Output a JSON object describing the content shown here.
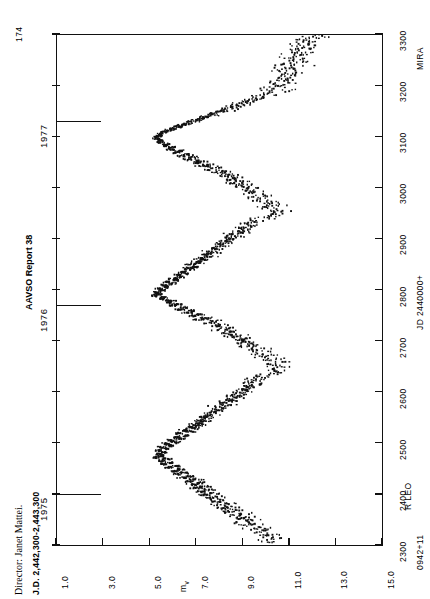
{
  "page": {
    "number": "174",
    "report_title": "AAVSO Report 38",
    "director": "Director: Janet Mattei.",
    "jd_range_note": "J.D. 2,442,300-2,443,300"
  },
  "star": {
    "designation": "0942+11",
    "name": "R LEO",
    "type": "MIRA"
  },
  "axes": {
    "magnitude": {
      "label": "m",
      "label_sub": "v",
      "ticks": [
        "1.0",
        "3.0",
        "5.0",
        "7.0",
        "9.0",
        "11.0",
        "13.0",
        "15.0"
      ],
      "min": 1.0,
      "max": 15.0
    },
    "time": {
      "label": "JD 2440000+",
      "ticks": [
        "2300",
        "2400",
        "2500",
        "2600",
        "2700",
        "2800",
        "2900",
        "3000",
        "3100",
        "3200",
        "3300"
      ],
      "min": 2300,
      "max": 3300
    },
    "years": [
      "1975",
      "1976",
      "1977"
    ],
    "year_jd": [
      2400,
      2770,
      3130
    ]
  },
  "chart_data": {
    "type": "scatter",
    "xlabel": "JD 2440000+",
    "ylabel": "mv",
    "xlim": [
      2300,
      3300
    ],
    "ylim": [
      1.0,
      15.0
    ],
    "y_inverted": true,
    "grid": false,
    "legend": null,
    "orientation": "rotated-90",
    "maxima": [
      {
        "jd": 2475,
        "mv": 5.4
      },
      {
        "jd": 2790,
        "mv": 5.2
      },
      {
        "jd": 3100,
        "mv": 5.3
      }
    ],
    "minima": [
      {
        "jd": 2330,
        "mv": 10.3
      },
      {
        "jd": 2640,
        "mv": 10.6
      },
      {
        "jd": 2950,
        "mv": 10.4
      }
    ],
    "period_days": 310,
    "points": [
      [
        2308,
        10.1
      ],
      [
        2312,
        9.9
      ],
      [
        2316,
        10.3
      ],
      [
        2320,
        9.8
      ],
      [
        2322,
        10.2
      ],
      [
        2326,
        9.6
      ],
      [
        2330,
        10.0
      ],
      [
        2333,
        9.4
      ],
      [
        2336,
        9.7
      ],
      [
        2340,
        9.2
      ],
      [
        2343,
        9.5
      ],
      [
        2346,
        9.0
      ],
      [
        2350,
        9.3
      ],
      [
        2353,
        8.8
      ],
      [
        2356,
        9.1
      ],
      [
        2360,
        8.6
      ],
      [
        2363,
        8.9
      ],
      [
        2366,
        8.4
      ],
      [
        2370,
        8.7
      ],
      [
        2373,
        8.2
      ],
      [
        2376,
        8.5
      ],
      [
        2380,
        8.0
      ],
      [
        2383,
        8.3
      ],
      [
        2386,
        7.8
      ],
      [
        2390,
        8.1
      ],
      [
        2393,
        7.6
      ],
      [
        2396,
        7.9
      ],
      [
        2400,
        7.4
      ],
      [
        2403,
        7.7
      ],
      [
        2406,
        7.2
      ],
      [
        2410,
        7.5
      ],
      [
        2413,
        7.0
      ],
      [
        2416,
        7.3
      ],
      [
        2420,
        6.8
      ],
      [
        2423,
        7.1
      ],
      [
        2426,
        6.6
      ],
      [
        2430,
        6.9
      ],
      [
        2433,
        6.4
      ],
      [
        2436,
        6.7
      ],
      [
        2440,
        6.2
      ],
      [
        2443,
        6.5
      ],
      [
        2446,
        6.0
      ],
      [
        2450,
        6.3
      ],
      [
        2453,
        5.8
      ],
      [
        2456,
        6.1
      ],
      [
        2460,
        5.6
      ],
      [
        2463,
        5.9
      ],
      [
        2466,
        5.5
      ],
      [
        2470,
        5.7
      ],
      [
        2473,
        5.3
      ],
      [
        2476,
        5.5
      ],
      [
        2480,
        5.4
      ],
      [
        2483,
        5.6
      ],
      [
        2486,
        5.4
      ],
      [
        2490,
        5.7
      ],
      [
        2493,
        5.5
      ],
      [
        2496,
        5.9
      ],
      [
        2500,
        5.7
      ],
      [
        2503,
        6.1
      ],
      [
        2506,
        5.9
      ],
      [
        2510,
        6.3
      ],
      [
        2513,
        6.1
      ],
      [
        2516,
        6.5
      ],
      [
        2520,
        6.3
      ],
      [
        2523,
        6.7
      ],
      [
        2526,
        6.5
      ],
      [
        2530,
        6.9
      ],
      [
        2533,
        6.8
      ],
      [
        2536,
        7.1
      ],
      [
        2540,
        7.0
      ],
      [
        2543,
        7.3
      ],
      [
        2546,
        7.2
      ],
      [
        2550,
        7.5
      ],
      [
        2553,
        7.4
      ],
      [
        2556,
        7.7
      ],
      [
        2560,
        7.6
      ],
      [
        2563,
        7.9
      ],
      [
        2566,
        7.8
      ],
      [
        2570,
        8.1
      ],
      [
        2573,
        8.0
      ],
      [
        2576,
        8.3
      ],
      [
        2580,
        8.2
      ],
      [
        2583,
        8.5
      ],
      [
        2586,
        8.4
      ],
      [
        2590,
        8.7
      ],
      [
        2593,
        8.6
      ],
      [
        2596,
        8.9
      ],
      [
        2600,
        8.8
      ],
      [
        2603,
        9.1
      ],
      [
        2606,
        9.0
      ],
      [
        2610,
        9.3
      ],
      [
        2613,
        9.2
      ],
      [
        2616,
        9.5
      ],
      [
        2620,
        9.4
      ],
      [
        2623,
        9.7
      ],
      [
        2626,
        9.6
      ],
      [
        2630,
        9.9
      ],
      [
        2633,
        10.0
      ],
      [
        2636,
        10.2
      ],
      [
        2640,
        10.4
      ],
      [
        2643,
        10.5
      ],
      [
        2646,
        10.3
      ],
      [
        2650,
        10.6
      ],
      [
        2653,
        10.4
      ],
      [
        2656,
        10.2
      ],
      [
        2660,
        10.5
      ],
      [
        2663,
        10.1
      ],
      [
        2666,
        10.3
      ],
      [
        2670,
        9.9
      ],
      [
        2673,
        10.1
      ],
      [
        2676,
        9.7
      ],
      [
        2680,
        9.9
      ],
      [
        2683,
        9.5
      ],
      [
        2686,
        9.7
      ],
      [
        2690,
        9.3
      ],
      [
        2693,
        9.5
      ],
      [
        2696,
        9.1
      ],
      [
        2700,
        9.2
      ],
      [
        2703,
        8.8
      ],
      [
        2706,
        9.0
      ],
      [
        2710,
        8.6
      ],
      [
        2713,
        8.8
      ],
      [
        2716,
        8.3
      ],
      [
        2720,
        8.5
      ],
      [
        2723,
        8.1
      ],
      [
        2726,
        8.3
      ],
      [
        2730,
        7.8
      ],
      [
        2733,
        8.0
      ],
      [
        2736,
        7.5
      ],
      [
        2740,
        7.7
      ],
      [
        2743,
        7.2
      ],
      [
        2746,
        7.4
      ],
      [
        2750,
        6.9
      ],
      [
        2753,
        7.1
      ],
      [
        2756,
        6.6
      ],
      [
        2760,
        6.8
      ],
      [
        2763,
        6.3
      ],
      [
        2766,
        6.5
      ],
      [
        2770,
        6.0
      ],
      [
        2773,
        6.2
      ],
      [
        2776,
        5.8
      ],
      [
        2780,
        5.9
      ],
      [
        2783,
        5.5
      ],
      [
        2786,
        5.6
      ],
      [
        2790,
        5.2
      ],
      [
        2793,
        5.4
      ],
      [
        2796,
        5.3
      ],
      [
        2800,
        5.5
      ],
      [
        2803,
        5.4
      ],
      [
        2806,
        5.7
      ],
      [
        2810,
        5.6
      ],
      [
        2813,
        5.9
      ],
      [
        2816,
        5.8
      ],
      [
        2820,
        6.1
      ],
      [
        2823,
        6.0
      ],
      [
        2826,
        6.3
      ],
      [
        2830,
        6.2
      ],
      [
        2833,
        6.5
      ],
      [
        2836,
        6.4
      ],
      [
        2840,
        6.7
      ],
      [
        2843,
        6.6
      ],
      [
        2846,
        6.9
      ],
      [
        2850,
        6.8
      ],
      [
        2853,
        7.1
      ],
      [
        2856,
        7.0
      ],
      [
        2860,
        7.3
      ],
      [
        2863,
        7.2
      ],
      [
        2866,
        7.5
      ],
      [
        2870,
        7.4
      ],
      [
        2873,
        7.7
      ],
      [
        2876,
        7.6
      ],
      [
        2880,
        7.9
      ],
      [
        2883,
        7.8
      ],
      [
        2886,
        8.1
      ],
      [
        2890,
        8.0
      ],
      [
        2893,
        8.3
      ],
      [
        2896,
        8.2
      ],
      [
        2900,
        8.5
      ],
      [
        2903,
        8.4
      ],
      [
        2906,
        8.7
      ],
      [
        2910,
        8.6
      ],
      [
        2913,
        8.9
      ],
      [
        2916,
        8.8
      ],
      [
        2920,
        9.1
      ],
      [
        2923,
        9.0
      ],
      [
        2926,
        9.3
      ],
      [
        2930,
        9.2
      ],
      [
        2933,
        9.5
      ],
      [
        2936,
        9.7
      ],
      [
        2940,
        9.9
      ],
      [
        2943,
        10.1
      ],
      [
        2946,
        10.3
      ],
      [
        2950,
        10.4
      ],
      [
        2953,
        10.2
      ],
      [
        2956,
        10.5
      ],
      [
        2960,
        10.3
      ],
      [
        2963,
        10.1
      ],
      [
        2966,
        10.4
      ],
      [
        2970,
        10.0
      ],
      [
        2973,
        10.2
      ],
      [
        2976,
        9.8
      ],
      [
        2980,
        10.0
      ],
      [
        2983,
        9.6
      ],
      [
        2986,
        9.8
      ],
      [
        2990,
        9.4
      ],
      [
        2993,
        9.6
      ],
      [
        2996,
        9.2
      ],
      [
        3000,
        9.3
      ],
      [
        3003,
        8.9
      ],
      [
        3006,
        9.1
      ],
      [
        3010,
        8.7
      ],
      [
        3013,
        8.9
      ],
      [
        3016,
        8.4
      ],
      [
        3020,
        8.6
      ],
      [
        3023,
        8.2
      ],
      [
        3026,
        8.4
      ],
      [
        3030,
        7.9
      ],
      [
        3033,
        8.1
      ],
      [
        3036,
        7.6
      ],
      [
        3040,
        7.8
      ],
      [
        3043,
        7.3
      ],
      [
        3046,
        7.5
      ],
      [
        3050,
        7.0
      ],
      [
        3053,
        7.2
      ],
      [
        3056,
        6.7
      ],
      [
        3060,
        6.9
      ],
      [
        3063,
        6.4
      ],
      [
        3066,
        6.6
      ],
      [
        3070,
        6.1
      ],
      [
        3073,
        6.3
      ],
      [
        3076,
        5.9
      ],
      [
        3080,
        6.0
      ],
      [
        3083,
        5.6
      ],
      [
        3086,
        5.7
      ],
      [
        3090,
        5.4
      ],
      [
        3093,
        5.5
      ],
      [
        3096,
        5.3
      ],
      [
        3100,
        5.3
      ],
      [
        3103,
        5.4
      ],
      [
        3106,
        5.5
      ],
      [
        3110,
        5.6
      ],
      [
        3113,
        5.8
      ],
      [
        3116,
        6.0
      ],
      [
        3120,
        6.2
      ],
      [
        3123,
        6.4
      ],
      [
        3126,
        6.6
      ],
      [
        3130,
        6.8
      ],
      [
        3133,
        7.0
      ],
      [
        3136,
        7.2
      ],
      [
        3140,
        7.4
      ],
      [
        3143,
        7.6
      ],
      [
        3146,
        7.8
      ],
      [
        3150,
        8.0
      ],
      [
        3153,
        8.2
      ],
      [
        3156,
        8.4
      ],
      [
        3160,
        8.6
      ],
      [
        3163,
        8.8
      ],
      [
        3166,
        9.0
      ],
      [
        3170,
        9.2
      ],
      [
        3173,
        9.4
      ],
      [
        3176,
        9.6
      ],
      [
        3180,
        9.8
      ],
      [
        3183,
        10.0
      ],
      [
        3186,
        10.2
      ],
      [
        3190,
        10.4
      ],
      [
        3193,
        10.5
      ],
      [
        3196,
        10.3
      ],
      [
        3200,
        10.6
      ],
      [
        3203,
        10.4
      ],
      [
        3206,
        10.7
      ],
      [
        3210,
        10.5
      ],
      [
        3213,
        10.8
      ],
      [
        3216,
        10.6
      ],
      [
        3220,
        10.9
      ],
      [
        3223,
        10.7
      ],
      [
        3226,
        11.0
      ],
      [
        3230,
        10.8
      ],
      [
        3233,
        11.1
      ],
      [
        3236,
        10.9
      ],
      [
        3240,
        11.2
      ],
      [
        3243,
        11.0
      ],
      [
        3246,
        11.3
      ],
      [
        3250,
        11.1
      ],
      [
        3253,
        11.4
      ],
      [
        3256,
        11.2
      ],
      [
        3260,
        11.5
      ],
      [
        3263,
        11.3
      ],
      [
        3266,
        11.6
      ],
      [
        3270,
        11.4
      ],
      [
        3273,
        11.7
      ],
      [
        3276,
        11.5
      ],
      [
        3280,
        11.8
      ],
      [
        3283,
        11.6
      ],
      [
        3286,
        11.9
      ],
      [
        3290,
        11.7
      ],
      [
        3293,
        12.0
      ],
      [
        3296,
        11.8
      ],
      [
        3300,
        12.1
      ]
    ]
  }
}
